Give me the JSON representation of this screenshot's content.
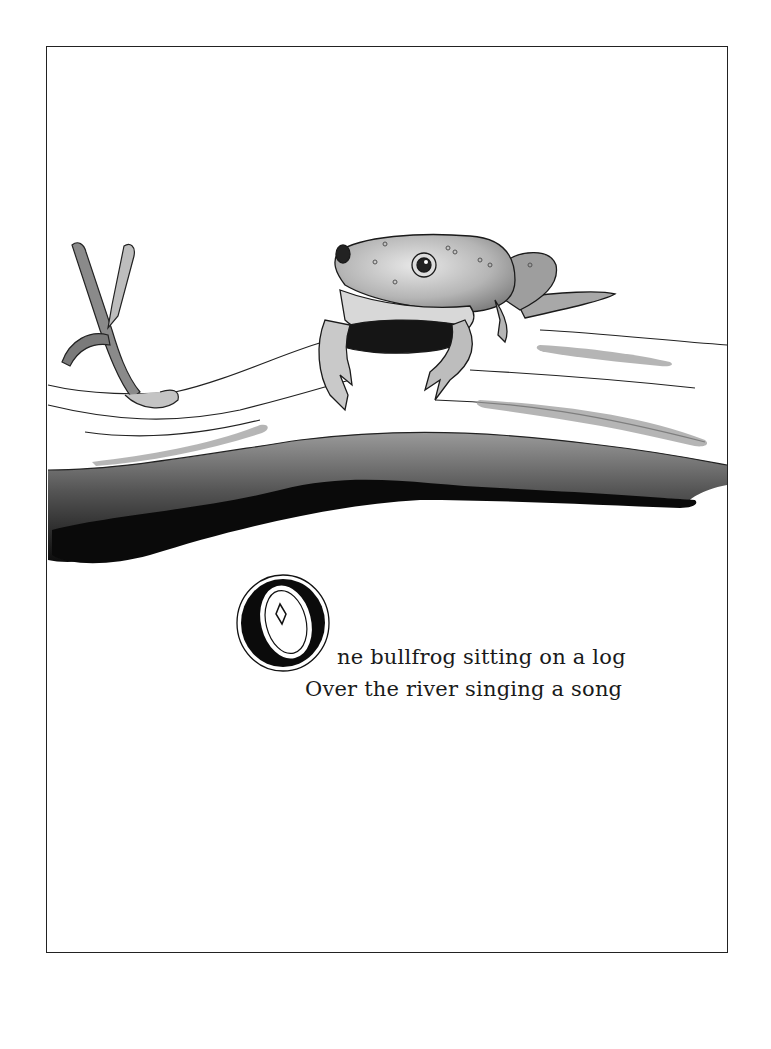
{
  "page": {
    "type": "illustrated book page",
    "frame": {
      "border_color": "#222222",
      "background": "#ffffff"
    }
  },
  "illustration": {
    "subject": "bullfrog sitting on a log",
    "elements": [
      "frog-figure",
      "log",
      "forked-branch",
      "log-shadow"
    ],
    "palette": {
      "ink": "#111111",
      "wash_dark": "#3a3a3a",
      "wash_mid": "#8a8a8a",
      "wash_light": "#c9c9c9"
    }
  },
  "verse": {
    "drop_cap": "O",
    "line1_rest": "ne bullfrog sitting on a log",
    "line2": "Over the river singing a song"
  }
}
